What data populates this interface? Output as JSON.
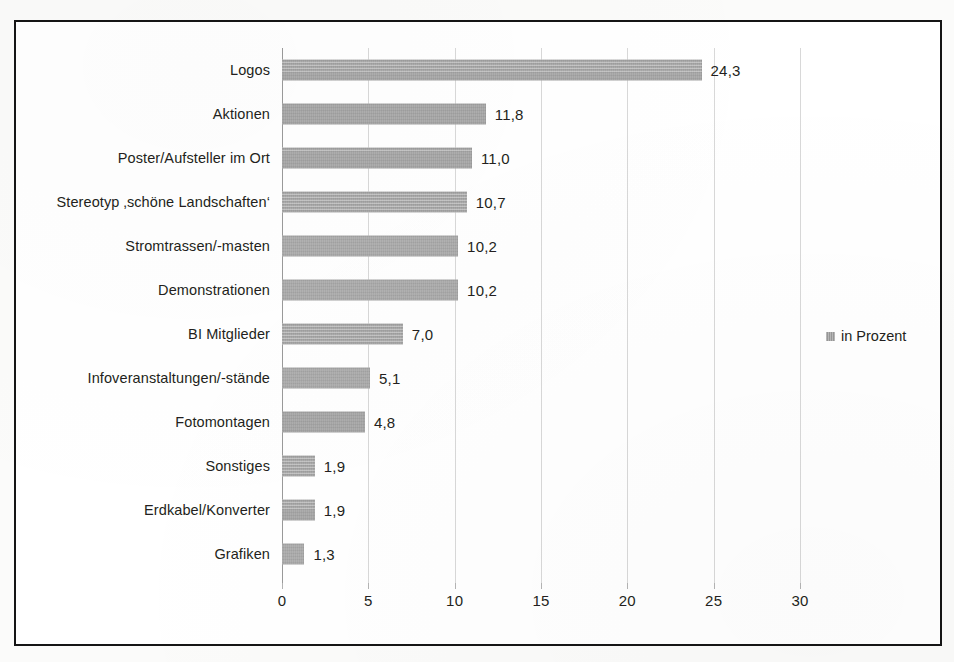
{
  "chart_data": {
    "type": "bar",
    "orientation": "horizontal",
    "title": "",
    "xlabel": "",
    "ylabel": "",
    "xlim": [
      0,
      30
    ],
    "xticks": [
      "0",
      "5",
      "10",
      "15",
      "20",
      "25",
      "30"
    ],
    "grid": true,
    "legend": {
      "position": "right",
      "entries": [
        "in Prozent"
      ]
    },
    "series": [
      {
        "name": "in Prozent",
        "color": "#a9a9a9",
        "values": [
          24.3,
          11.8,
          11.0,
          10.7,
          10.2,
          10.2,
          7.0,
          5.1,
          4.8,
          1.9,
          1.9,
          1.3
        ],
        "value_labels": [
          "24,3",
          "11,8",
          "11,0",
          "10,7",
          "10,2",
          "10,2",
          "7,0",
          "5,1",
          "4,8",
          "1,9",
          "1,9",
          "1,3"
        ]
      }
    ],
    "categories": [
      "Logos",
      "Aktionen",
      "Poster/Aufsteller im Ort",
      "Stereotyp ‚schöne Landschaften‘",
      "Stromtrassen/-masten",
      "Demonstrationen",
      "BI Mitglieder",
      "Infoveranstaltungen/-stände",
      "Fotomontagen",
      "Sonstiges",
      "Erdkabel/Konverter",
      "Grafiken"
    ]
  },
  "style": {
    "frame_color": "#151515",
    "bar_color": "#a9a9a9",
    "grid_color": "#d8d8d8",
    "text_color": "#231f20",
    "background": "#ffffff"
  }
}
